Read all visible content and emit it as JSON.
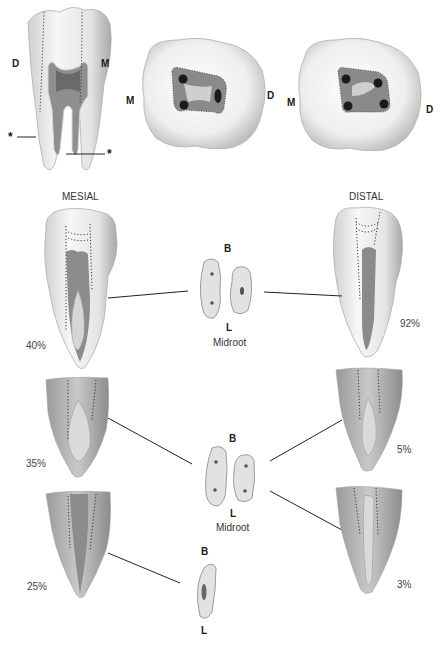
{
  "top_row": {
    "side_view": {
      "left_label": "D",
      "right_label": "M",
      "marker_symbol": "★",
      "marker_left": "*",
      "marker_right": "*"
    },
    "occlusal_view_1": {
      "left_label": "M",
      "right_label": "D",
      "canal_count": 3
    },
    "occlusal_view_2": {
      "left_label": "M",
      "right_label": "D",
      "canal_count": 4
    }
  },
  "columns": {
    "mesial_title": "MESIAL",
    "distal_title": "DISTAL"
  },
  "rows": [
    {
      "mesial_percent": "40%",
      "distal_percent": "92%",
      "cross_section": {
        "top_label": "B",
        "bottom_label": "L",
        "caption": "Midroot"
      }
    },
    {
      "mesial_percent": "35%",
      "distal_percent": "5%",
      "cross_section": {
        "top_label": "B",
        "bottom_label": "L",
        "caption": "Midroot"
      }
    },
    {
      "mesial_percent": "25%",
      "distal_percent": "3%",
      "cross_section": {
        "top_label": "B",
        "bottom_label": "L",
        "caption": ""
      }
    }
  ],
  "colors": {
    "enamel": "#f2f2f2",
    "root": "#bdbdbd",
    "canal": "#8a8a8a",
    "pulp": "#6e6e6e",
    "line": "#222222",
    "section_fill": "#e0e0e0"
  }
}
